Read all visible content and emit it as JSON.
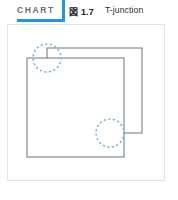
{
  "header": {
    "chart_tag": "CHART",
    "figure_number": "図 1.7",
    "figure_title": "T-junction",
    "accent_color": "#2196e8",
    "tag_color": "#6b6f73"
  },
  "frame": {
    "border_color": "#dfe4e8",
    "background": "#ffffff"
  },
  "diagram": {
    "type": "line-drawing",
    "stroke_color": "#6e7276",
    "stroke_width": 1,
    "fill": "#ffffff",
    "shapes": [
      {
        "name": "back-rectangle",
        "x": 47,
        "y": 48,
        "width": 95,
        "height": 85
      },
      {
        "name": "front-rectangle",
        "x": 27,
        "y": 58,
        "width": 97,
        "height": 99
      }
    ],
    "annotations": [
      {
        "name": "t-junction-upper-left",
        "shape": "dotted-circle",
        "cx": 47,
        "cy": 58,
        "r": 14,
        "color": "#7fb8dd",
        "dash": "1 3.6"
      },
      {
        "name": "t-junction-lower-right",
        "shape": "dotted-circle",
        "cx": 110,
        "cy": 133,
        "r": 14,
        "color": "#7fb8dd",
        "dash": "1 3.6"
      }
    ]
  }
}
